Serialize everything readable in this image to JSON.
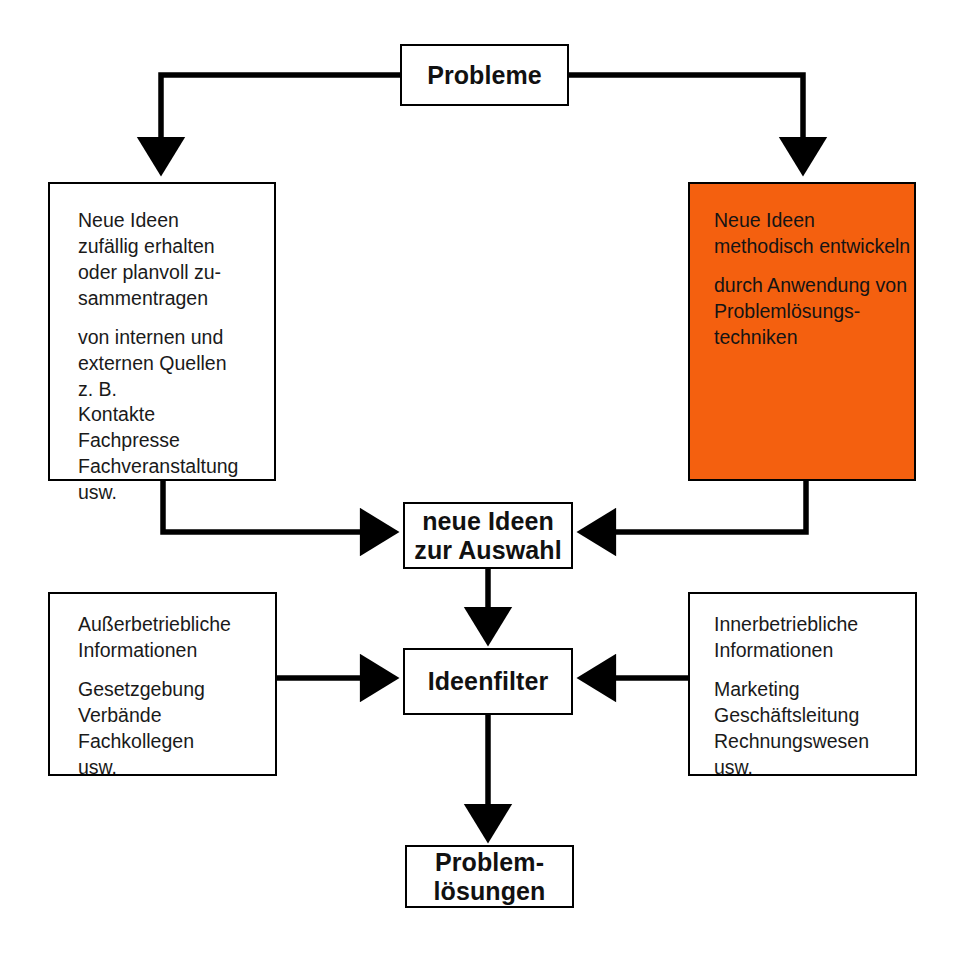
{
  "diagram": {
    "colors": {
      "accent_orange": "#F4600F",
      "line": "#000000",
      "box_fill": "#FFFFFF",
      "text": "#111111"
    },
    "nodes": {
      "probleme": {
        "label": "Probleme"
      },
      "zufall": {
        "paragraphs": [
          [
            "Neue Ideen",
            "zufällig erhalten",
            "oder planvoll zu-",
            "sammentragen"
          ],
          [
            "von internen und",
            "externen Quellen",
            "z. B.",
            "Kontakte",
            "Fachpresse",
            "Fachveranstaltung",
            "usw."
          ]
        ]
      },
      "methodisch": {
        "paragraphs": [
          [
            "Neue Ideen",
            "methodisch entwickeln"
          ],
          [
            "durch Anwendung von",
            "Problemlösungs-",
            "techniken"
          ]
        ]
      },
      "auswahl": {
        "lines": [
          "neue Ideen",
          "zur Auswahl"
        ]
      },
      "ideenfilter": {
        "label": "Ideenfilter"
      },
      "ausserbetrieblich": {
        "paragraphs": [
          [
            "Außerbetriebliche",
            "Informationen"
          ],
          [
            "Gesetzgebung",
            "Verbände",
            "Fachkollegen",
            "usw."
          ]
        ]
      },
      "innerbetrieblich": {
        "paragraphs": [
          [
            "Innerbetriebliche",
            "Informationen"
          ],
          [
            "Marketing",
            "Geschäftsleitung",
            "Rechnungswesen",
            "usw."
          ]
        ]
      },
      "problemloesungen": {
        "lines": [
          "Problem-",
          "lösungen"
        ]
      }
    },
    "edges": [
      {
        "name": "probleme-to-zufall",
        "from": "probleme",
        "to": "zufall"
      },
      {
        "name": "probleme-to-methodisch",
        "from": "probleme",
        "to": "methodisch"
      },
      {
        "name": "zufall-to-auswahl",
        "from": "zufall",
        "to": "auswahl"
      },
      {
        "name": "methodisch-to-auswahl",
        "from": "methodisch",
        "to": "auswahl"
      },
      {
        "name": "auswahl-to-ideenfilter",
        "from": "auswahl",
        "to": "ideenfilter"
      },
      {
        "name": "ausserbetrieblich-to-ideenfilter",
        "from": "ausserbetrieblich",
        "to": "ideenfilter"
      },
      {
        "name": "innerbetrieblich-to-ideenfilter",
        "from": "innerbetrieblich",
        "to": "ideenfilter"
      },
      {
        "name": "ideenfilter-to-problemloesungen",
        "from": "ideenfilter",
        "to": "problemloesungen"
      }
    ]
  }
}
